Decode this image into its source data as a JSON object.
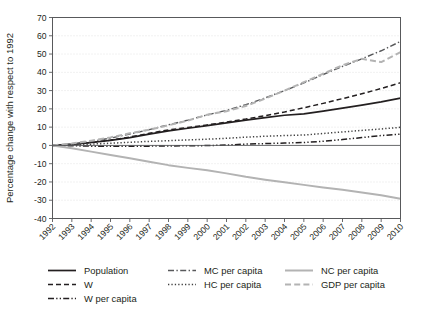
{
  "chart_data": {
    "type": "line",
    "title": "",
    "xlabel": "",
    "ylabel": "Percentage change with respect to 1992",
    "xlim": [
      1992,
      2010
    ],
    "ylim": [
      -40,
      70
    ],
    "ytick_step": 10,
    "grid": true,
    "legend_position": "bottom",
    "x": [
      1992,
      1993,
      1994,
      1995,
      1996,
      1997,
      1998,
      1999,
      2000,
      2001,
      2002,
      2003,
      2004,
      2005,
      2006,
      2007,
      2008,
      2009,
      2010
    ],
    "xticklabels": [
      "1992",
      "1993",
      "1994",
      "1995",
      "1996",
      "1997",
      "1998",
      "1999",
      "2000",
      "2001",
      "2002",
      "2003",
      "2004",
      "2005",
      "2006",
      "2007",
      "2008",
      "2009",
      "2010"
    ],
    "yticklabels": [
      "70",
      "60",
      "50",
      "40",
      "30",
      "20",
      "10",
      "0",
      "-10",
      "-20",
      "-30",
      "-40"
    ],
    "yticks": [
      70,
      60,
      50,
      40,
      30,
      20,
      10,
      0,
      -10,
      -20,
      -30,
      -40
    ],
    "series": [
      {
        "name": "Population",
        "style": "solid",
        "color": "#231f20",
        "width": 1.7,
        "values": [
          0,
          0.6,
          1.6,
          2.8,
          4.3,
          6.2,
          8.0,
          9.4,
          10.8,
          12.3,
          13.8,
          15.2,
          16.5,
          17.3,
          18.8,
          20.4,
          22.0,
          23.8,
          25.9
        ]
      },
      {
        "name": "W",
        "style": "dashed",
        "color": "#231f20",
        "width": 1.5,
        "values": [
          0,
          0.5,
          1.5,
          2.9,
          4.6,
          6.6,
          8.5,
          9.8,
          11.2,
          12.8,
          14.4,
          16.3,
          18.3,
          20.6,
          23.0,
          25.6,
          28.3,
          31.1,
          34.3
        ]
      },
      {
        "name": "W per capita",
        "style": "dashdotdot",
        "color": "#231f20",
        "width": 1.5,
        "values": [
          0,
          -0.2,
          -0.4,
          -0.5,
          -0.5,
          -0.4,
          -0.3,
          -0.2,
          -0.1,
          0.2,
          0.7,
          1.0,
          1.3,
          1.6,
          2.3,
          3.2,
          4.3,
          5.4,
          6.2
        ]
      },
      {
        "name": "MC per capita",
        "style": "dashdot",
        "color": "#58595b",
        "width": 1.4,
        "values": [
          0,
          0.8,
          2.2,
          4.0,
          6.2,
          8.6,
          11.3,
          13.8,
          16.7,
          19.2,
          22.3,
          26.0,
          30.0,
          34.2,
          38.8,
          43.2,
          47.4,
          51.8,
          56.9
        ]
      },
      {
        "name": "HC per capita",
        "style": "dotted",
        "color": "#404040",
        "width": 1.5,
        "values": [
          0,
          0.3,
          0.7,
          1.2,
          1.7,
          2.2,
          2.6,
          3.0,
          3.4,
          3.9,
          4.5,
          5.0,
          5.4,
          5.7,
          6.5,
          7.4,
          8.2,
          9.0,
          9.9
        ]
      },
      {
        "name": "NC per capita",
        "style": "solid",
        "color": "#b3b3b3",
        "width": 2.0,
        "values": [
          0,
          -1.6,
          -3.4,
          -5.2,
          -7.0,
          -8.9,
          -10.8,
          -12.3,
          -13.6,
          -15.3,
          -17.2,
          -18.8,
          -20.2,
          -21.6,
          -23.0,
          -24.3,
          -25.8,
          -27.3,
          -29.2
        ]
      },
      {
        "name": "GDP per capita",
        "style": "dashed-gray",
        "color": "#b3b3b3",
        "width": 2.0,
        "values": [
          0,
          1.0,
          2.6,
          4.4,
          6.6,
          8.6,
          11.0,
          13.6,
          16.8,
          18.7,
          21.6,
          25.6,
          30.0,
          34.6,
          39.2,
          43.9,
          47.4,
          45.6,
          51.0
        ]
      }
    ]
  },
  "legend": {
    "items": [
      {
        "label": "Population",
        "swatch": "solid-black-line"
      },
      {
        "label": "W",
        "swatch": "dashed-black-line"
      },
      {
        "label": "W per capita",
        "swatch": "dashdotdot-black-line"
      },
      {
        "label": "MC per capita",
        "swatch": "dashdot-gray-line"
      },
      {
        "label": "HC per capita",
        "swatch": "dotted-gray-line"
      },
      {
        "label": "NC per capita",
        "swatch": "solid-lightgray-line"
      },
      {
        "label": "GDP per capita",
        "swatch": "dashed-lightgray-line"
      }
    ]
  },
  "colors": {
    "black": "#231f20",
    "dark_gray": "#58595b",
    "light_gray": "#b3b3b3",
    "grid": "#d9d9d9",
    "background": "#ffffff"
  }
}
